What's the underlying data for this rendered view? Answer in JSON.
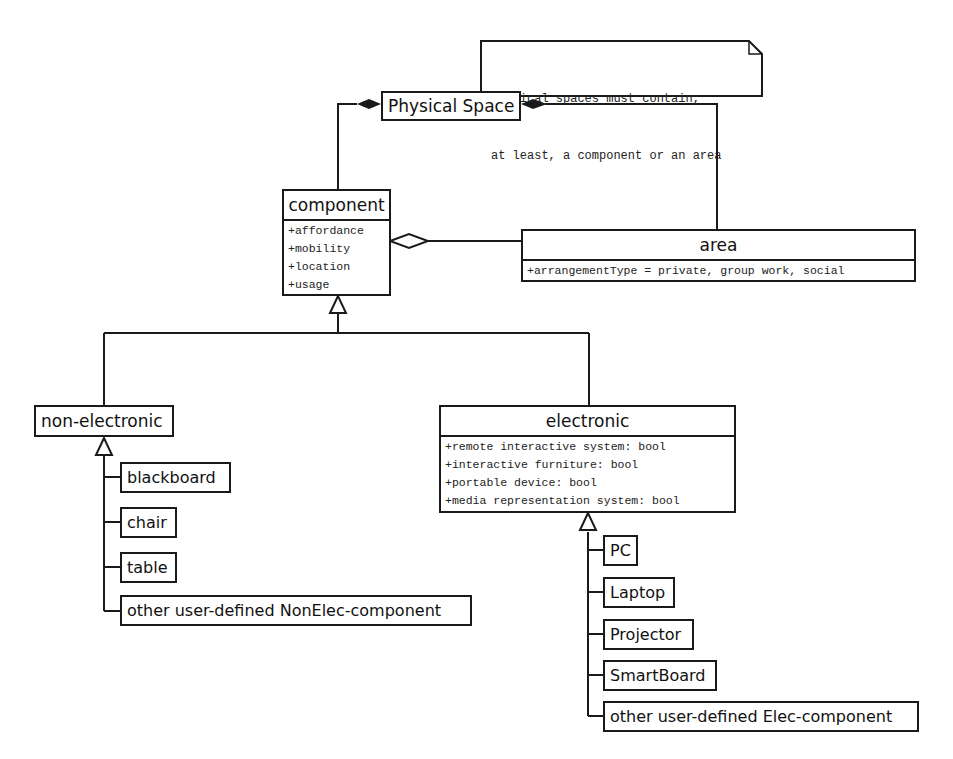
{
  "diagram": {
    "type": "UML class diagram",
    "note": {
      "lines": [
        "Physical spaces must contain,",
        "at least, a component or an area"
      ]
    },
    "classes": {
      "physical_space": {
        "name": "Physical Space"
      },
      "component": {
        "name": "component",
        "attributes": [
          "+affordance",
          "+mobility",
          "+location",
          "+usage"
        ]
      },
      "area": {
        "name": "area",
        "attributes": [
          "+arrangementType = private, group work, social"
        ]
      },
      "non_electronic": {
        "name": "non-electronic"
      },
      "electronic": {
        "name": "electronic",
        "attributes": [
          "+remote interactive system: bool",
          "+interactive furniture: bool",
          "+portable device: bool",
          "+media representation system: bool"
        ]
      }
    },
    "non_electronic_children": [
      "blackboard",
      "chair",
      "table",
      "other user-defined NonElec-component"
    ],
    "electronic_children": [
      "PC",
      "Laptop",
      "Projector",
      "SmartBoard",
      "other user-defined Elec-component"
    ],
    "relationships": [
      {
        "from": "Physical Space",
        "to": "component",
        "kind": "composition"
      },
      {
        "from": "Physical Space",
        "to": "area",
        "kind": "composition"
      },
      {
        "from": "component",
        "to": "area",
        "kind": "aggregation"
      },
      {
        "from": "non-electronic",
        "to": "component",
        "kind": "generalization"
      },
      {
        "from": "electronic",
        "to": "component",
        "kind": "generalization"
      },
      {
        "from": "non-electronic children",
        "to": "non-electronic",
        "kind": "generalization"
      },
      {
        "from": "electronic children",
        "to": "electronic",
        "kind": "generalization"
      }
    ],
    "colors": {
      "line": "#1a1a1a",
      "background": "#ffffff"
    }
  }
}
